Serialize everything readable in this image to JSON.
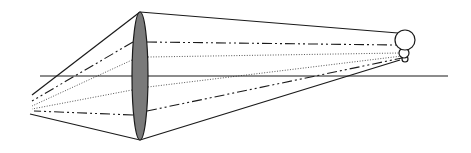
{
  "diagram": {
    "type": "optical-ray-diagram",
    "colors": {
      "line": "#1a1a1a",
      "lens_fill": "#7a7a7a",
      "background": "#ffffff"
    },
    "optical_axis": {
      "x1": 40,
      "y1": 76,
      "x2": 448,
      "y2": 76
    },
    "lens": {
      "cx": 140,
      "cy": 76,
      "rx": 8,
      "ry": 64
    },
    "object": {
      "circles": [
        {
          "name": "head",
          "cx": 405,
          "cy": 40,
          "r": 10
        },
        {
          "name": "middle",
          "cx": 404,
          "cy": 53,
          "r": 5
        },
        {
          "name": "base",
          "cx": 405,
          "cy": 59,
          "r": 3
        }
      ]
    },
    "rays_right": [
      {
        "style": "solid",
        "x1": 140,
        "y1": 12,
        "x2": 398,
        "y2": 33
      },
      {
        "style": "dashdot",
        "x1": 147,
        "y1": 42,
        "x2": 396,
        "y2": 45
      },
      {
        "style": "dotted",
        "x1": 148,
        "y1": 57,
        "x2": 400,
        "y2": 53
      },
      {
        "style": "dotted",
        "x1": 148,
        "y1": 87,
        "x2": 402,
        "y2": 56
      },
      {
        "style": "dashdot",
        "x1": 147,
        "y1": 111,
        "x2": 402,
        "y2": 58
      },
      {
        "style": "solid",
        "x1": 140,
        "y1": 140,
        "x2": 400,
        "y2": 60
      }
    ],
    "rays_left": [
      {
        "style": "solid",
        "x1": 140,
        "y1": 12,
        "x2": 32,
        "y2": 95
      },
      {
        "style": "dashdot",
        "x1": 133,
        "y1": 42,
        "x2": 32,
        "y2": 101
      },
      {
        "style": "dotted",
        "x1": 132,
        "y1": 60,
        "x2": 32,
        "y2": 106
      },
      {
        "style": "dotted",
        "x1": 132,
        "y1": 90,
        "x2": 32,
        "y2": 109
      },
      {
        "style": "dashdot",
        "x1": 133,
        "y1": 115,
        "x2": 34,
        "y2": 111
      },
      {
        "style": "solid",
        "x1": 140,
        "y1": 140,
        "x2": 30,
        "y2": 114
      }
    ]
  }
}
